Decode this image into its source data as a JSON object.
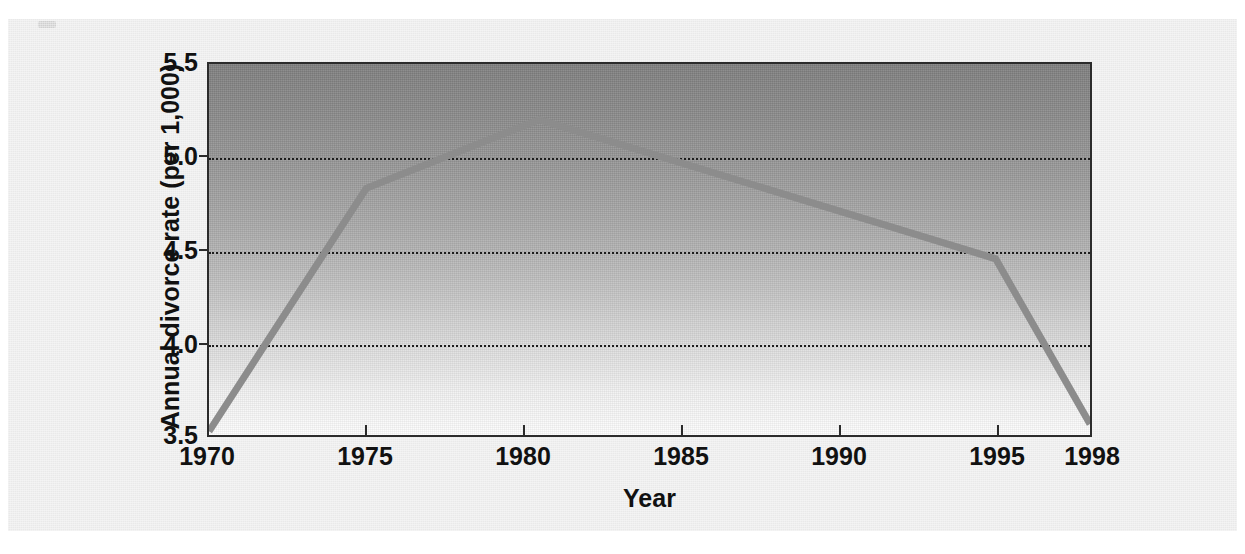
{
  "figure": {
    "background_color": "#e9e9e9",
    "plot_border_color": "#2b2b2b",
    "line_color": "#8c8c8c",
    "gridline_color": "#1d1d1d"
  },
  "chart_data": {
    "type": "line",
    "title": "",
    "xlabel": "Year",
    "ylabel": "Annual divorce rate (per 1,000)",
    "x": [
      1970,
      1975,
      1980.5,
      1995,
      1998
    ],
    "values": [
      3.52,
      4.83,
      5.2,
      4.45,
      3.56
    ],
    "series": [
      {
        "name": "Annual divorce rate",
        "x": [
          1970,
          1975,
          1980.5,
          1995,
          1998
        ],
        "values": [
          3.52,
          4.83,
          5.2,
          4.45,
          3.56
        ]
      }
    ],
    "xlim": [
      1970,
      1998
    ],
    "ylim": [
      3.5,
      5.5
    ],
    "xticks": [
      1970,
      1975,
      1980,
      1985,
      1990,
      1995,
      1998
    ],
    "xticklabels": [
      "1970",
      "1975",
      "1980",
      "1985",
      "1990",
      "1995",
      "1998"
    ],
    "yticks": [
      3.5,
      4.0,
      4.5,
      5.0,
      5.5
    ],
    "yticklabels": [
      "3.5",
      "4.0",
      "4.5",
      "5.0",
      "5.5"
    ],
    "gridlines_y": [
      4.0,
      4.5,
      5.0
    ],
    "grid": true,
    "legend": "none"
  },
  "axis": {
    "y_labels": [
      "5.5",
      "5.0",
      "4.5",
      "4.0",
      "3.5"
    ],
    "x_labels": [
      "1970",
      "1975",
      "1980",
      "1985",
      "1990",
      "1995",
      "1998"
    ],
    "y_title": "Annual divorce rate (per 1,000)",
    "x_title": "Year"
  }
}
